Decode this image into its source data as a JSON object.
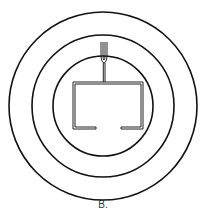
{
  "figure": {
    "label": "B.",
    "colors": {
      "stroke": "#111111",
      "background": "#ffffff"
    },
    "circles": [
      {
        "name": "outer-ring",
        "cx": 103,
        "cy": 106,
        "r": 94
      },
      {
        "name": "middle-ring",
        "cx": 103,
        "cy": 106,
        "r": 71
      },
      {
        "name": "inner-ring",
        "cx": 103,
        "cy": 106,
        "r": 50
      }
    ]
  }
}
